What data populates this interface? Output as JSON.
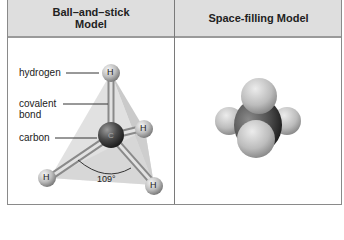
{
  "table": {
    "headers": [
      "Ball–and–stick Model",
      "Space-filling Model"
    ],
    "header_lines_left": [
      "Ball–and–stick",
      "Model"
    ]
  },
  "ball_and_stick": {
    "labels": {
      "hydrogen": "hydrogen",
      "covalent_line1": "covalent",
      "covalent_line2": "bond",
      "carbon": "carbon"
    },
    "atom_symbols": {
      "hydrogen": "H",
      "carbon": "C"
    },
    "angle": "109°"
  },
  "colors": {
    "header_bg": "#dedede",
    "border": "#8a8a8a",
    "tetrahedron": "#d2d2d2",
    "hydrogen_atom": "#c8c8c8",
    "carbon_atom": "#505050"
  }
}
